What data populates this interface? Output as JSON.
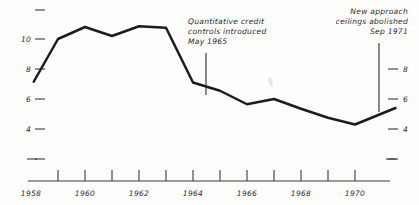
{
  "chart_data": {
    "type": "line",
    "title": "",
    "subtitle": "",
    "xlabel": "",
    "ylabel": "",
    "xlim": [
      1958,
      1971.8
    ],
    "ylim": [
      2,
      12
    ],
    "grid": false,
    "legend": "none",
    "y_ticks_left": [
      "",
      "10",
      "8",
      "6",
      "4",
      ""
    ],
    "y_tick_values_left": [
      12,
      10,
      8,
      6,
      4,
      2
    ],
    "y_ticks_right": [
      "",
      "8",
      "6",
      "4",
      ""
    ],
    "y_tick_values_right": [
      10,
      8,
      6,
      4,
      2
    ],
    "x_ticks": [
      1959,
      1960,
      1961,
      1962,
      1963,
      1964,
      1965,
      1966,
      1967,
      1968,
      1969,
      1970,
      1971
    ],
    "x_tick_labels": [
      "1958",
      "1960",
      "1962",
      "1964",
      "1966",
      "1968",
      "1970"
    ],
    "x_tick_label_values": [
      1958,
      1960,
      1962,
      1964,
      1966,
      1968,
      1970
    ],
    "x": [
      1958.1,
      1959.0,
      1960.0,
      1961.0,
      1962.0,
      1963.0,
      1964.0,
      1965.0,
      1966.0,
      1967.0,
      1968.0,
      1969.0,
      1970.0,
      1971.5
    ],
    "values": [
      7.15,
      10.0,
      10.8,
      10.2,
      10.85,
      10.75,
      7.1,
      6.55,
      5.65,
      6.0,
      5.35,
      4.75,
      4.3,
      5.4
    ],
    "series": [
      {
        "name": "series-1",
        "values": [
          7.15,
          10.0,
          10.8,
          10.2,
          10.85,
          10.75,
          7.1,
          6.55,
          5.65,
          6.0,
          5.35,
          4.75,
          4.3,
          5.4
        ]
      }
    ],
    "annotations": [
      {
        "id": "annotation-credit-controls",
        "lines": [
          "Quantitative  credit",
          "controls  introduced",
          "May  1965"
        ],
        "text": "Quantitative credit controls introduced May 1965",
        "align": "left",
        "pointer_x": 1964.5
      },
      {
        "id": "annotation-ceilings-abolished",
        "lines": [
          "New approach",
          "ceilings abolished",
          "Sep 1971"
        ],
        "text": "New approach ceilings abolished Sep 1971",
        "align": "right",
        "pointer_x": 1971.4
      }
    ]
  },
  "colors": {
    "line": "#1c1c1c",
    "axis": "#3a3a38",
    "text": "#2b2b2b",
    "background": "#fdfdfb"
  }
}
